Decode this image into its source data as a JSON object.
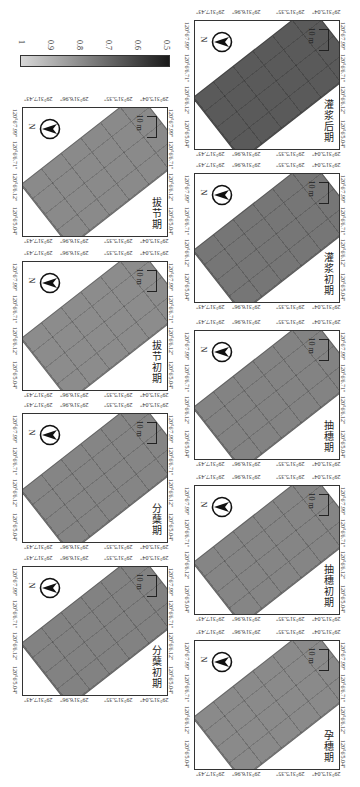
{
  "figure": {
    "orientation": "rotated 90 degrees clockwise",
    "colorbar": {
      "ticks": [
        "1",
        "0.9",
        "0.8",
        "0.7",
        "0.6",
        "0.5"
      ],
      "gradient_from": "#d8d8d8",
      "gradient_to": "#1a1a1a"
    },
    "common": {
      "north_label": "N",
      "scale_label": "10 m",
      "lat_ticks": [
        "29°31'7.43\"",
        "29°31'6.96\"",
        "29°31'5.35\"",
        "29°31'5.04\""
      ],
      "lon_ticks": [
        "120°6'5.04\"",
        "120°6'6.12\"",
        "120°6'6.71\"",
        "120°6'7.99\""
      ]
    },
    "panels": [
      {
        "label": "拔节期",
        "color": "#8a8a8a",
        "column": "left",
        "top": 107
      },
      {
        "label": "拔节初期",
        "color": "#8c8c8c",
        "column": "left",
        "top": 261
      },
      {
        "label": "分蘖期",
        "color": "#858585",
        "column": "left",
        "top": 413
      },
      {
        "label": "分蘖初期",
        "color": "#828282",
        "column": "left",
        "top": 566
      },
      {
        "label": "灌浆后期",
        "color": "#5a5a5a",
        "column": "right",
        "top": 20
      },
      {
        "label": "灌浆初期",
        "color": "#767676",
        "column": "right",
        "top": 173
      },
      {
        "label": "抽穗期",
        "color": "#838383",
        "column": "right",
        "top": 330
      },
      {
        "label": "抽穗初期",
        "color": "#858585",
        "column": "right",
        "top": 485
      },
      {
        "label": "孕穗期",
        "color": "#8a8a8a",
        "column": "right",
        "top": 640
      }
    ]
  }
}
